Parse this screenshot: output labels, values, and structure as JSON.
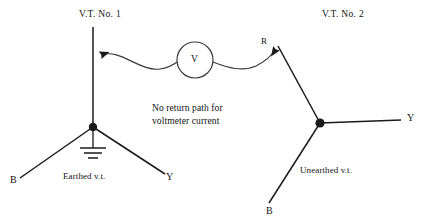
{
  "figure": {
    "type": "electrical-schematic",
    "background_color": "#ffffff",
    "line_color": "#1a1a1a",
    "text_color": "#111111"
  },
  "titles": {
    "vt1": "V.T. No. 1",
    "vt2": "V.T. No. 2"
  },
  "captions": {
    "main_line1": "No return path for",
    "main_line2": "voltmeter current",
    "earthed": "Earthed v.t.",
    "unearthed": "Unearthed v.t."
  },
  "meter": {
    "symbol": "V",
    "name": "voltmeter"
  },
  "vt1_terminals": {
    "r_label": "",
    "b_label": "B",
    "y_label": "Y"
  },
  "vt2_terminals": {
    "r_label": "R",
    "b_label": "B",
    "y_label": "Y"
  }
}
